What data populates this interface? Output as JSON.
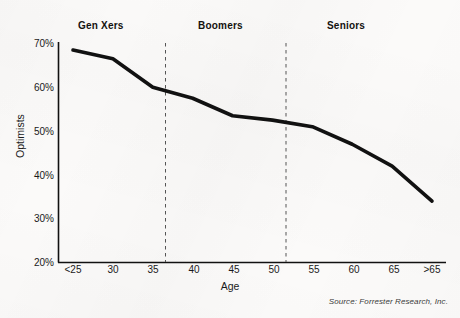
{
  "chart_data": {
    "type": "line",
    "title": "",
    "xlabel": "Age",
    "ylabel": "Optimists",
    "x": [
      "<25",
      "30",
      "35",
      "40",
      "45",
      "50",
      "55",
      "60",
      "65",
      ">65"
    ],
    "categories": [
      "<25",
      "30",
      "35",
      "40",
      "45",
      "50",
      "55",
      "60",
      "65",
      ">65"
    ],
    "values": [
      68.5,
      66.5,
      60.0,
      57.5,
      53.5,
      52.5,
      51.0,
      47.0,
      42.0,
      34.0
    ],
    "series": [
      {
        "name": "Optimists",
        "values": [
          68.5,
          66.5,
          60.0,
          57.5,
          53.5,
          52.5,
          51.0,
          47.0,
          42.0,
          34.0
        ]
      }
    ],
    "ylim": [
      20,
      70
    ],
    "ytick_labels": [
      "70%",
      "60%",
      "50%",
      "40%",
      "30%",
      "20%"
    ],
    "ytick_values": [
      70,
      60,
      50,
      40,
      30,
      20
    ],
    "xtick_labels": [
      "<25",
      "30",
      "35",
      "40",
      "45",
      "50",
      "55",
      "60",
      "65",
      ">65"
    ],
    "grid": false,
    "legend": "none",
    "line_color": "#111111",
    "background_color": "#fbfaf9",
    "annotations": [
      {
        "label": "Gen Xers",
        "type": "band-label"
      },
      {
        "label": "Boomers",
        "type": "band-label"
      },
      {
        "label": "Seniors",
        "type": "band-label"
      }
    ],
    "dividers": [
      {
        "at_age": 36.3,
        "style": "dashed"
      },
      {
        "at_age": 51.5,
        "style": "dashed"
      }
    ]
  },
  "bands": {
    "genxers": "Gen Xers",
    "boomers": "Boomers",
    "seniors": "Seniors"
  },
  "axes": {
    "y_title": "Optimists",
    "x_title": "Age",
    "y_ticks": [
      "70%",
      "60%",
      "50%",
      "40%",
      "30%",
      "20%"
    ],
    "x_ticks": [
      "<25",
      "30",
      "35",
      "40",
      "45",
      "50",
      "55",
      "60",
      "65",
      ">65"
    ]
  },
  "footer": {
    "source": "Source: Forrester Research, Inc."
  }
}
